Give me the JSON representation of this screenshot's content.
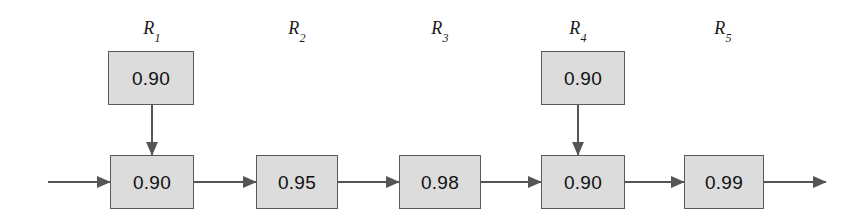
{
  "diagram": {
    "type": "reliability-block-diagram",
    "title": "",
    "background_color": "#ffffff",
    "block_fill_color": "#dcdcdc",
    "block_border_color": "#5a5a5a",
    "connector_color": "#555555",
    "text_color": "#111111",
    "stage_labels": [
      {
        "base": "R",
        "subscript": "1",
        "text": "R1",
        "x": 152,
        "y": 30
      },
      {
        "base": "R",
        "subscript": "2",
        "text": "R2",
        "x": 297,
        "y": 30
      },
      {
        "base": "R",
        "subscript": "3",
        "text": "R3",
        "x": 440,
        "y": 30
      },
      {
        "base": "R",
        "subscript": "4",
        "text": "R4",
        "x": 578,
        "y": 30
      },
      {
        "base": "R",
        "subscript": "5",
        "text": "R5",
        "x": 723,
        "y": 30
      }
    ],
    "blocks": [
      {
        "id": "r1-redundant",
        "stage": "R1",
        "row": "top",
        "value": "0.90",
        "x": 108,
        "y": 51,
        "w": 86,
        "h": 54
      },
      {
        "id": "r1-main",
        "stage": "R1",
        "row": "bottom",
        "value": "0.90",
        "x": 110,
        "y": 155,
        "w": 84,
        "h": 54
      },
      {
        "id": "r2-main",
        "stage": "R2",
        "row": "bottom",
        "value": "0.95",
        "x": 256,
        "y": 155,
        "w": 82,
        "h": 54
      },
      {
        "id": "r3-main",
        "stage": "R3",
        "row": "bottom",
        "value": "0.98",
        "x": 399,
        "y": 155,
        "w": 82,
        "h": 54
      },
      {
        "id": "r4-redundant",
        "stage": "R4",
        "row": "top",
        "value": "0.90",
        "x": 541,
        "y": 51,
        "w": 84,
        "h": 54
      },
      {
        "id": "r4-main",
        "stage": "R4",
        "row": "bottom",
        "value": "0.90",
        "x": 541,
        "y": 155,
        "w": 84,
        "h": 54
      },
      {
        "id": "r5-main",
        "stage": "R5",
        "row": "bottom",
        "value": "0.99",
        "x": 684,
        "y": 155,
        "w": 80,
        "h": 54
      }
    ],
    "connectors": [
      {
        "id": "input-arrow",
        "from": "input",
        "to": "r1-main",
        "orientation": "horizontal",
        "x1": 48,
        "y1": 182,
        "x2": 110,
        "y2": 182
      },
      {
        "id": "r1-to-r2",
        "from": "r1-main",
        "to": "r2-main",
        "orientation": "horizontal",
        "x1": 194,
        "y1": 182,
        "x2": 256,
        "y2": 182
      },
      {
        "id": "r2-to-r3",
        "from": "r2-main",
        "to": "r3-main",
        "orientation": "horizontal",
        "x1": 338,
        "y1": 182,
        "x2": 399,
        "y2": 182
      },
      {
        "id": "r3-to-r4",
        "from": "r3-main",
        "to": "r4-main",
        "orientation": "horizontal",
        "x1": 481,
        "y1": 182,
        "x2": 541,
        "y2": 182
      },
      {
        "id": "r4-to-r5",
        "from": "r4-main",
        "to": "r5-main",
        "orientation": "horizontal",
        "x1": 625,
        "y1": 182,
        "x2": 684,
        "y2": 182
      },
      {
        "id": "output-arrow",
        "from": "r5-main",
        "to": "output",
        "orientation": "horizontal",
        "x1": 764,
        "y1": 182,
        "x2": 826,
        "y2": 182
      },
      {
        "id": "r1-redundant-down",
        "from": "r1-redundant",
        "to": "r1-main",
        "orientation": "vertical",
        "x1": 152,
        "y1": 105,
        "x2": 152,
        "y2": 155
      },
      {
        "id": "r4-redundant-down",
        "from": "r4-redundant",
        "to": "r4-main",
        "orientation": "vertical",
        "x1": 578,
        "y1": 105,
        "x2": 578,
        "y2": 155
      }
    ]
  }
}
